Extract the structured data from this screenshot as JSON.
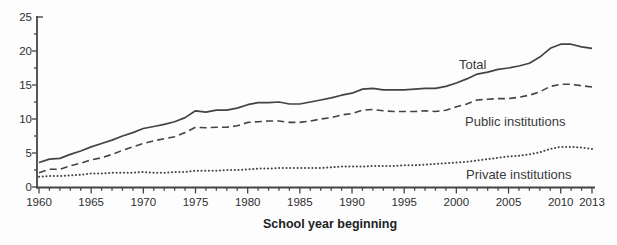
{
  "chart": {
    "line_color": "#434343",
    "tick_color": "#454545",
    "background": "#fdfdfd"
  },
  "chart_data": {
    "type": "line",
    "title": "",
    "xlabel": "School year beginning",
    "ylabel": "",
    "units": "millions of students",
    "ylim": [
      0,
      25
    ],
    "xlim": [
      1960,
      2013
    ],
    "grid": false,
    "legend_position": "inline-labels-right",
    "ytick_labels": [
      "0",
      "5",
      "10",
      "15",
      "20",
      "25"
    ],
    "yticks": [
      0,
      5,
      10,
      15,
      20,
      25
    ],
    "y_minor_tick_step": 2.5,
    "x_minor_tick_every": 1,
    "xtick_major_years": [
      1960,
      1965,
      1970,
      1975,
      1980,
      1985,
      1990,
      1995,
      2000,
      2005,
      2010,
      2013
    ],
    "xtick_labels": [
      "1960",
      "1965",
      "1970",
      "1975",
      "1980",
      "1985",
      "1990",
      "1995",
      "2000",
      "2005",
      "2010",
      "2013"
    ],
    "x": [
      1960,
      1961,
      1962,
      1963,
      1964,
      1965,
      1966,
      1967,
      1968,
      1969,
      1970,
      1971,
      1972,
      1973,
      1974,
      1975,
      1976,
      1977,
      1978,
      1979,
      1980,
      1981,
      1982,
      1983,
      1984,
      1985,
      1986,
      1987,
      1988,
      1989,
      1990,
      1991,
      1992,
      1993,
      1994,
      1995,
      1996,
      1997,
      1998,
      1999,
      2000,
      2001,
      2002,
      2003,
      2004,
      2005,
      2006,
      2007,
      2008,
      2009,
      2010,
      2011,
      2012,
      2013
    ],
    "series": [
      {
        "name": "Total",
        "line_style": "solid",
        "values": [
          3.6,
          4.1,
          4.2,
          4.8,
          5.3,
          5.9,
          6.4,
          6.9,
          7.5,
          8.0,
          8.6,
          8.9,
          9.2,
          9.6,
          10.2,
          11.2,
          11.0,
          11.3,
          11.3,
          11.6,
          12.1,
          12.4,
          12.4,
          12.5,
          12.2,
          12.2,
          12.5,
          12.8,
          13.1,
          13.5,
          13.8,
          14.4,
          14.5,
          14.3,
          14.3,
          14.3,
          14.4,
          14.5,
          14.5,
          14.8,
          15.3,
          15.9,
          16.6,
          16.9,
          17.3,
          17.5,
          17.8,
          18.2,
          19.1,
          20.4,
          21.0,
          21.0,
          20.6,
          20.4
        ]
      },
      {
        "name": "Public institutions",
        "line_style": "dashed",
        "values": [
          2.1,
          2.6,
          2.6,
          3.1,
          3.5,
          4.0,
          4.3,
          4.8,
          5.4,
          5.9,
          6.4,
          6.8,
          7.1,
          7.4,
          8.0,
          8.8,
          8.7,
          8.8,
          8.8,
          9.0,
          9.5,
          9.6,
          9.7,
          9.7,
          9.5,
          9.5,
          9.7,
          10.0,
          10.2,
          10.6,
          10.8,
          11.3,
          11.4,
          11.2,
          11.1,
          11.1,
          11.1,
          11.2,
          11.1,
          11.3,
          11.8,
          12.2,
          12.8,
          12.9,
          13.0,
          13.0,
          13.2,
          13.5,
          14.0,
          14.8,
          15.1,
          15.1,
          14.9,
          14.7
        ]
      },
      {
        "name": "Private institutions",
        "line_style": "dotted",
        "values": [
          1.5,
          1.6,
          1.6,
          1.7,
          1.8,
          2.0,
          2.0,
          2.1,
          2.1,
          2.1,
          2.2,
          2.1,
          2.1,
          2.2,
          2.2,
          2.4,
          2.4,
          2.4,
          2.5,
          2.5,
          2.6,
          2.7,
          2.7,
          2.8,
          2.8,
          2.8,
          2.8,
          2.8,
          2.9,
          3.0,
          3.0,
          3.0,
          3.1,
          3.1,
          3.1,
          3.2,
          3.2,
          3.3,
          3.4,
          3.5,
          3.6,
          3.7,
          3.9,
          4.1,
          4.3,
          4.5,
          4.6,
          4.8,
          5.1,
          5.6,
          5.9,
          5.9,
          5.8,
          5.6
        ]
      }
    ]
  }
}
